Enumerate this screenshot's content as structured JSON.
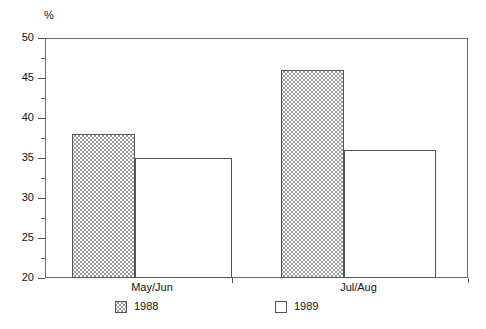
{
  "chart_data": {
    "type": "bar",
    "title": "",
    "subtitle": "",
    "xlabel": "",
    "ylabel": "%",
    "categories": [
      "May/Jun",
      "Jul/Aug"
    ],
    "series": [
      {
        "name": "1988",
        "values": [
          38,
          46
        ],
        "fill": "crosshatch"
      },
      {
        "name": "1989",
        "values": [
          35,
          36
        ],
        "fill": "none"
      }
    ],
    "ylim": [
      20,
      50
    ],
    "ytick_major": [
      20,
      25,
      30,
      35,
      40,
      45,
      50
    ],
    "ytick_minor": [
      22.5,
      27.5,
      32.5,
      37.5,
      42.5,
      47.5
    ],
    "ytick_labels": [
      "20",
      "25",
      "30",
      "35",
      "40",
      "45",
      "50"
    ],
    "grid": false,
    "legend_position": "bottom",
    "colors": {
      "axis": "#6b6b6b",
      "bar_outline": "#555555",
      "hatch": "#9a9a9a",
      "background": "#ffffff",
      "text": "#111111"
    }
  },
  "axes": {
    "unit_label": "%"
  },
  "legend": {
    "entries": [
      {
        "label": "1988",
        "swatch": "crosshatch-swatch"
      },
      {
        "label": "1989",
        "swatch": "empty-swatch"
      }
    ]
  }
}
